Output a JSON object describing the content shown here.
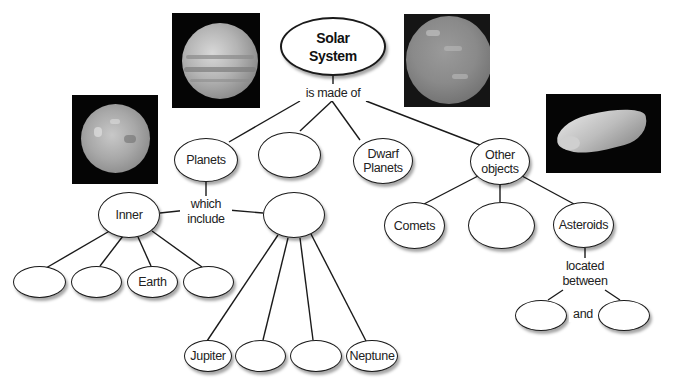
{
  "root": {
    "label_line1": "Solar",
    "label_line2": "System"
  },
  "links": {
    "is_made_of": "is made of",
    "which_include_1": "which",
    "which_include_2": "include",
    "located_between_1": "located",
    "located_between_2": "between",
    "and": "and"
  },
  "level1": {
    "planets": "Planets",
    "blank": "",
    "dwarf_planets_1": "Dwarf",
    "dwarf_planets_2": "Planets",
    "other_objects_1": "Other",
    "other_objects_2": "objects"
  },
  "planets_children": {
    "inner": "Inner",
    "outer": ""
  },
  "inner_planets": [
    "",
    "",
    "Earth",
    ""
  ],
  "outer_planets": [
    "Jupiter",
    "",
    "",
    "Neptune"
  ],
  "other_objects_children": [
    "Comets",
    "",
    "Asteroids"
  ],
  "asteroid_location": [
    "",
    ""
  ],
  "images": [
    {
      "name": "Jupiter photo"
    },
    {
      "name": "Dwarf planet photo"
    },
    {
      "name": "Mars photo"
    },
    {
      "name": "Asteroid photo"
    }
  ],
  "colors": {
    "line": "#1a1a1a",
    "node_border": "#1a1a1a",
    "background": "#ffffff",
    "photo_bg": "#050505"
  }
}
